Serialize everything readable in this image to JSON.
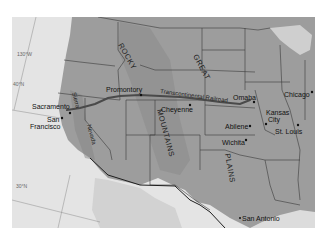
{
  "map": {
    "type": "historical-map",
    "subject": "Transcontinental Railroad, western United States",
    "colors": {
      "ocean": "#e4e4e4",
      "land": "#9d9d9d",
      "mountains": "#8a8a8a",
      "mexico": "#d2d2d2",
      "state_border": "#3a3a3a",
      "railroad": "#4a4a4a"
    },
    "graticule": {
      "lon_130": "130°W",
      "lat_40": "40°N",
      "lat_30": "30°N"
    },
    "regions": {
      "rocky": "ROCKY",
      "mountains": "MOUNTAINS",
      "great": "GREAT",
      "plains": "PLAINS",
      "sierra": "Sierra",
      "nevada": "Nevada"
    },
    "railroad_label": "Transcontinental Railroad",
    "cities": [
      {
        "name": "Sacramento"
      },
      {
        "name": "San"
      },
      {
        "name": "Francisco"
      },
      {
        "name": "Promontory"
      },
      {
        "name": "Cheyenne"
      },
      {
        "name": "Omaha"
      },
      {
        "name": "Chicago"
      },
      {
        "name": "Kansas"
      },
      {
        "name": "City"
      },
      {
        "name": "Abilene"
      },
      {
        "name": "St. Louis"
      },
      {
        "name": "Wichita"
      },
      {
        "name": "San Antonio"
      }
    ]
  }
}
